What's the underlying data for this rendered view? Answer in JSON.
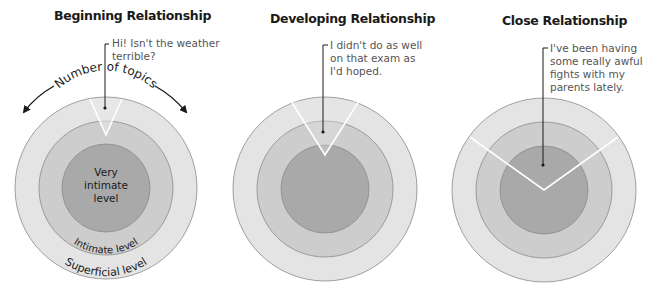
{
  "panels": [
    {
      "title": "Beginning Relationship",
      "callout": "Hi! Isn't the weather\nterrible?",
      "stage": "beginning"
    },
    {
      "title": "Developing Relationship",
      "callout": "I didn't do as well\non that exam as\nI'd hoped.",
      "stage": "developing"
    },
    {
      "title": "Close Relationship",
      "callout": "I've been having\nsome really awful\nfights with my\nparents lately.",
      "stage": "close"
    }
  ],
  "labels": {
    "breadth": "Number of topics",
    "inner": "Very intimate level",
    "inner_line1": "Very",
    "inner_line2": "intimate",
    "inner_line3": "level",
    "middle": "Intimate level",
    "outer": "Superficial level"
  },
  "colors": {
    "outer_ring": "#e4e4e4",
    "middle_ring": "#cdcdcd",
    "inner_ring": "#a9a9a9",
    "ring_stroke": "#8a8a8a",
    "wedge_line": "#ffffff",
    "text": "#1a1a1a",
    "callout_text": "#555555"
  }
}
